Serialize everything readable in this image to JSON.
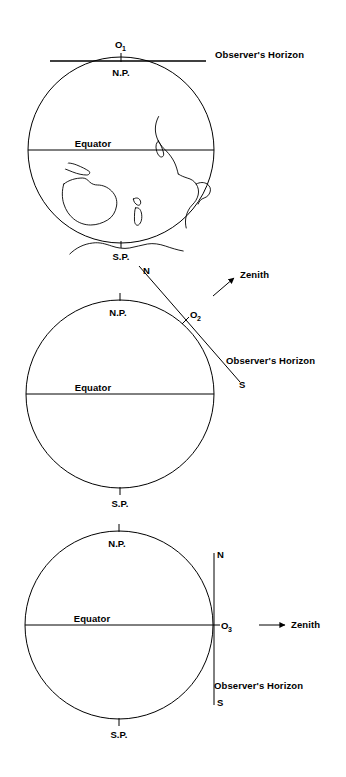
{
  "figure": {
    "background_color": "#ffffff",
    "line_color": "#000000",
    "width": 346,
    "height": 777
  },
  "diagrams": [
    {
      "id": "diagram-1",
      "observer_label": "O",
      "observer_subscript": "1",
      "horizon_label": "Observer's Horizon",
      "north_pole_label": "N.P.",
      "equator_label": "Equator",
      "south_pole_label": "S.P.",
      "horizon_orientation": "horizontal",
      "observer_position": "north-pole",
      "zenith_label": null,
      "compass_north_label": null,
      "compass_south_label": null
    },
    {
      "id": "diagram-2",
      "observer_label": "O",
      "observer_subscript": "2",
      "horizon_label": "Observer's Horizon",
      "north_pole_label": "N.P.",
      "equator_label": "Equator",
      "south_pole_label": "S.P.",
      "horizon_orientation": "diagonal",
      "observer_position": "mid-latitude",
      "zenith_label": "Zenith",
      "compass_north_label": "N",
      "compass_south_label": "S"
    },
    {
      "id": "diagram-3",
      "observer_label": "O",
      "observer_subscript": "3",
      "horizon_label": "Observer's Horizon",
      "north_pole_label": "N.P.",
      "equator_label": "Equator",
      "south_pole_label": "S.P.",
      "horizon_orientation": "vertical",
      "observer_position": "equator",
      "zenith_label": "Zenith",
      "compass_north_label": "N",
      "compass_south_label": "S"
    }
  ]
}
